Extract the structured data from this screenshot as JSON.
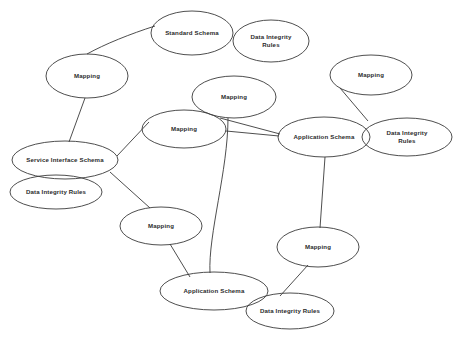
{
  "diagram": {
    "background_color": "#ffffff",
    "stroke_color": "#3a3a3a",
    "text_color": "#2b2b2b",
    "nodes": [
      {
        "id": "standard-schema",
        "label": "Standard Schema",
        "cx": 192,
        "cy": 33,
        "rx": 41,
        "ry": 22,
        "label_x": 192,
        "label_y": 33
      },
      {
        "id": "dir-standard",
        "label": "Data Integrity\nRules",
        "cx": 271,
        "cy": 41,
        "rx": 38,
        "ry": 21,
        "label_x": 271,
        "label_y": 41
      },
      {
        "id": "mapping-left-top",
        "label": "Mapping",
        "cx": 87,
        "cy": 76,
        "rx": 41,
        "ry": 22,
        "label_x": 87,
        "label_y": 76
      },
      {
        "id": "mapping-right-top",
        "label": "Mapping",
        "cx": 371,
        "cy": 75,
        "rx": 41,
        "ry": 20,
        "label_x": 371,
        "label_y": 75
      },
      {
        "id": "mapping-center-upper",
        "label": "Mapping",
        "cx": 234,
        "cy": 97,
        "rx": 42,
        "ry": 21,
        "label_x": 234,
        "label_y": 97
      },
      {
        "id": "mapping-center-lower",
        "label": "Mapping",
        "cx": 184,
        "cy": 129,
        "rx": 42,
        "ry": 19,
        "label_x": 184,
        "label_y": 129
      },
      {
        "id": "application-schema-right",
        "label": "Application Schema",
        "cx": 324,
        "cy": 137,
        "rx": 46,
        "ry": 20,
        "label_x": 324,
        "label_y": 137
      },
      {
        "id": "dir-application-right",
        "label": "Data Integrity Rules",
        "cx": 407,
        "cy": 137,
        "rx": 45,
        "ry": 19,
        "label_x": 407,
        "label_y": 137
      },
      {
        "id": "service-interface-schema",
        "label": "Service Interface Schema",
        "cx": 65,
        "cy": 160,
        "rx": 53,
        "ry": 19,
        "label_x": 65,
        "label_y": 160
      },
      {
        "id": "dir-service-interface",
        "label": "Data Integrity Rules",
        "cx": 56,
        "cy": 192,
        "rx": 46,
        "ry": 17,
        "label_x": 56,
        "label_y": 192
      },
      {
        "id": "mapping-bottom-left",
        "label": "Mapping",
        "cx": 161,
        "cy": 226,
        "rx": 41,
        "ry": 19,
        "label_x": 161,
        "label_y": 226
      },
      {
        "id": "mapping-bottom-right",
        "label": "Mapping",
        "cx": 318,
        "cy": 247,
        "rx": 41,
        "ry": 20,
        "label_x": 318,
        "label_y": 247
      },
      {
        "id": "application-schema-bottom",
        "label": "Application Schema",
        "cx": 214,
        "cy": 291,
        "rx": 54,
        "ry": 19,
        "label_x": 214,
        "label_y": 291
      },
      {
        "id": "dir-application-bottom",
        "label": "Data Integrity Rules",
        "cx": 290,
        "cy": 311,
        "rx": 44,
        "ry": 18,
        "label_x": 290,
        "label_y": 311
      }
    ],
    "edges": [
      {
        "id": "standard-to-mapping-left",
        "from": "standard-schema",
        "to": "mapping-left-top",
        "d": "M 155 26 C 130 34 105 44 87 54"
      },
      {
        "id": "mapping-left-to-service",
        "from": "mapping-left-top",
        "to": "service-interface-schema",
        "d": "M 85 98 L 69 142"
      },
      {
        "id": "service-to-mapping-center-lower",
        "from": "service-interface-schema",
        "to": "mapping-center-lower",
        "d": "M 117 156 L 149 122"
      },
      {
        "id": "service-to-mapping-bottom-left",
        "from": "service-interface-schema",
        "to": "mapping-bottom-left",
        "d": "M 110 172 L 150 208"
      },
      {
        "id": "mapping-center-upper-to-app-right",
        "from": "mapping-center-upper",
        "to": "application-schema-right",
        "d": "M 220 118 L 280 134"
      },
      {
        "id": "mapping-center-lower-to-app-right",
        "from": "mapping-center-lower",
        "to": "application-schema-right",
        "d": "M 226 131 L 279 136"
      },
      {
        "id": "mapping-center-upper-to-app-bottom",
        "from": "mapping-center-upper",
        "to": "application-schema-bottom",
        "d": "M 228 118 C 228 170 208 235 210 273"
      },
      {
        "id": "mapping-right-top-to-app-right",
        "from": "mapping-right-top",
        "to": "application-schema-right",
        "d": "M 340 88 L 368 121"
      },
      {
        "id": "app-right-to-mapping-bottom-right",
        "from": "application-schema-right",
        "to": "mapping-bottom-right",
        "d": "M 325 157 L 320 228"
      },
      {
        "id": "mapping-bottom-right-to-dir-bottom",
        "from": "mapping-bottom-right",
        "to": "dir-application-bottom",
        "d": "M 308 265 L 280 296"
      },
      {
        "id": "mapping-bottom-left-to-app-bottom",
        "from": "mapping-bottom-left",
        "to": "application-schema-bottom",
        "d": "M 170 244 L 190 277"
      }
    ]
  }
}
